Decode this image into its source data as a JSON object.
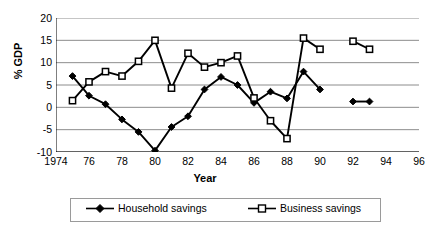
{
  "chart_data": {
    "type": "line",
    "title": "",
    "xlabel": "Year",
    "ylabel": "% GDP",
    "xlim": [
      1974,
      1996
    ],
    "ylim": [
      -10,
      20
    ],
    "ytick_values": [
      20,
      15,
      10,
      5,
      0,
      -5,
      -10
    ],
    "ytick_labels": [
      "20",
      "15",
      "10",
      "5",
      "0",
      "-5",
      "-10"
    ],
    "xtick_values": [
      1974,
      1976,
      1978,
      1980,
      1982,
      1984,
      1986,
      1988,
      1990,
      1992,
      1994,
      1996
    ],
    "xtick_labels": [
      "1974",
      "76",
      "78",
      "80",
      "82",
      "84",
      "86",
      "88",
      "90",
      "92",
      "94",
      "96"
    ],
    "grid": "horizontal",
    "legend_position": "bottom",
    "series": [
      {
        "name": "Household savings",
        "marker": "filled-diamond",
        "color": "#000000",
        "segments": [
          {
            "x": [
              1975,
              1976,
              1977,
              1978,
              1979,
              1980,
              1981,
              1982,
              1983,
              1984,
              1985,
              1986,
              1987,
              1988,
              1989,
              1990
            ],
            "y": [
              7.0,
              2.6,
              0.7,
              -2.7,
              -5.5,
              -9.7,
              -4.4,
              -2.0,
              4.0,
              6.8,
              5.0,
              1.0,
              3.5,
              2.0,
              8.0,
              4.0
            ]
          },
          {
            "x": [
              1992,
              1993
            ],
            "y": [
              1.3,
              1.3
            ]
          }
        ]
      },
      {
        "name": "Business savings",
        "marker": "open-square",
        "color": "#000000",
        "segments": [
          {
            "x": [
              1975,
              1976,
              1977,
              1978,
              1979,
              1980,
              1981,
              1982,
              1983,
              1984,
              1985,
              1986,
              1987,
              1988,
              1989,
              1990
            ],
            "y": [
              1.5,
              5.7,
              8.0,
              7.0,
              10.3,
              15.0,
              4.3,
              12.1,
              9.0,
              10.0,
              11.5,
              2.1,
              -3.0,
              -7.0,
              15.5,
              13.0
            ]
          },
          {
            "x": [
              1992,
              1993
            ],
            "y": [
              14.8,
              13.0
            ]
          }
        ]
      }
    ]
  },
  "legend": {
    "household_label": "Household savings",
    "business_label": "Business savings"
  }
}
